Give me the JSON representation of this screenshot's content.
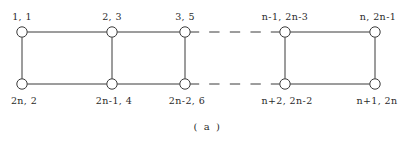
{
  "figure": {
    "caption": "( a )",
    "caption_x": 0,
    "caption_y": 122
  },
  "style": {
    "stroke_color": "#3a3a3a",
    "node_fill": "#ffffff",
    "text_color": "#2b2b2b",
    "background": "#ffffff",
    "node_radius": 5.2,
    "stroke_width": 1.0
  },
  "chart_data": {
    "type": "diagram",
    "diagram_kind": "ladder-graph",
    "title": "( a )",
    "rows": [
      "top",
      "bottom"
    ],
    "columns": 5,
    "ellipsis_between_columns": [
      3,
      4
    ],
    "ellipsis_dash_count": 3,
    "nodes": {
      "top": [
        {
          "id": "t1",
          "x": 22,
          "y": 32,
          "label": "1, 1",
          "label_x": 22,
          "label_y": 12
        },
        {
          "id": "t2",
          "x": 112,
          "y": 32,
          "label": "2, 3",
          "label_x": 112,
          "label_y": 12
        },
        {
          "id": "t3",
          "x": 185,
          "y": 32,
          "label": "3, 5",
          "label_x": 185,
          "label_y": 12
        },
        {
          "id": "t4",
          "x": 285,
          "y": 32,
          "label": "n-1, 2n-3",
          "label_x": 285,
          "label_y": 12
        },
        {
          "id": "t5",
          "x": 375,
          "y": 32,
          "label": "n, 2n-1",
          "label_x": 378,
          "label_y": 12
        }
      ],
      "bottom": [
        {
          "id": "b1",
          "x": 22,
          "y": 84,
          "label": "2n, 2",
          "label_x": 24,
          "label_y": 96
        },
        {
          "id": "b2",
          "x": 112,
          "y": 84,
          "label": "2n-1, 4",
          "label_x": 114,
          "label_y": 96
        },
        {
          "id": "b3",
          "x": 185,
          "y": 84,
          "label": "2n-2, 6",
          "label_x": 187,
          "label_y": 96
        },
        {
          "id": "b4",
          "x": 285,
          "y": 84,
          "label": "n+2, 2n-2",
          "label_x": 287,
          "label_y": 96
        },
        {
          "id": "b5",
          "x": 375,
          "y": 84,
          "label": "n+1, 2n",
          "label_x": 377,
          "label_y": 96
        }
      ]
    },
    "edges": [
      {
        "from": "t1",
        "to": "t2",
        "kind": "solid"
      },
      {
        "from": "t2",
        "to": "t3",
        "kind": "solid"
      },
      {
        "from": "t3",
        "to": "t4",
        "kind": "dashed-gap"
      },
      {
        "from": "t4",
        "to": "t5",
        "kind": "solid"
      },
      {
        "from": "b1",
        "to": "b2",
        "kind": "solid"
      },
      {
        "from": "b2",
        "to": "b3",
        "kind": "solid"
      },
      {
        "from": "b3",
        "to": "b4",
        "kind": "dashed-gap"
      },
      {
        "from": "b4",
        "to": "b5",
        "kind": "solid"
      },
      {
        "from": "t1",
        "to": "b1",
        "kind": "solid"
      },
      {
        "from": "t2",
        "to": "b2",
        "kind": "solid"
      },
      {
        "from": "t3",
        "to": "b3",
        "kind": "solid"
      },
      {
        "from": "t4",
        "to": "b4",
        "kind": "solid"
      },
      {
        "from": "t5",
        "to": "b5",
        "kind": "solid"
      }
    ]
  }
}
